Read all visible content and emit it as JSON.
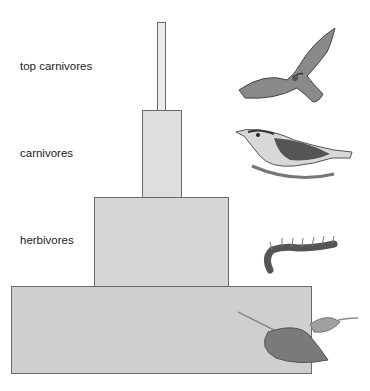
{
  "diagram": {
    "levels": [
      {
        "label": "top carnivores",
        "organism": "hawk"
      },
      {
        "label": "carnivores",
        "organism": "songbird"
      },
      {
        "label": "herbivores",
        "organism": "caterpillar"
      },
      {
        "label": "producers",
        "organism": "leaves"
      }
    ],
    "colors": {
      "top": "#ebebeb",
      "carnivores": "#dedede",
      "herbivores": "#d6d6d6",
      "producers": "#cfcfcf",
      "border": "#6a6a6a"
    }
  }
}
